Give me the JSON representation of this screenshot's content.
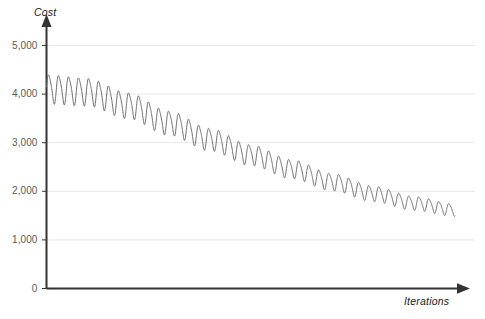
{
  "chart_data": {
    "type": "line",
    "title": "",
    "subtitle": "",
    "xlabel": "Iterations",
    "ylabel": "Cost",
    "grid": true,
    "legend": null,
    "legend_position": "none",
    "xlim": [
      0,
      1000
    ],
    "ylim": [
      0,
      5000
    ],
    "y_ticks": [
      0,
      1000,
      2000,
      3000,
      4000,
      5000
    ],
    "y_tick_labels": [
      "0",
      "1,000",
      "2,000",
      "3,000",
      "4,000",
      "5,000"
    ],
    "x_ticks": [],
    "x_tick_labels": [],
    "annotations": [],
    "series": [
      {
        "name": "Cost",
        "color": "#6e6e6e",
        "line_width": 1,
        "description": "High-frequency oscillating cost that decays from about 4,200 to about 1,550 over the run",
        "trend_points": [
          {
            "x": 0,
            "y": 4120
          },
          {
            "x": 100,
            "y": 4060
          },
          {
            "x": 200,
            "y": 3780
          },
          {
            "x": 300,
            "y": 3420
          },
          {
            "x": 400,
            "y": 3080
          },
          {
            "x": 500,
            "y": 2760
          },
          {
            "x": 600,
            "y": 2470
          },
          {
            "x": 700,
            "y": 2200
          },
          {
            "x": 800,
            "y": 1960
          },
          {
            "x": 900,
            "y": 1760
          },
          {
            "x": 1000,
            "y": 1620
          }
        ],
        "oscillation": {
          "period_x": 24.5,
          "amplitude_start": 290,
          "amplitude_end": 120,
          "waveform": "sine-with-sawtooth-bias"
        },
        "y_start": 4350,
        "y_end": 1550,
        "y_max": 4440,
        "y_min": 1440
      }
    ]
  },
  "axes": {
    "y_title": "Cost",
    "x_title": "Iterations",
    "y_tick_labels": [
      "5,000",
      "4,000",
      "3,000",
      "2,000",
      "1,000",
      "0"
    ],
    "axis_color": "#333333",
    "grid_color": "#e8e8e8",
    "tick_label_color": "#595959"
  },
  "colors": {
    "background": "#ffffff",
    "curve": "#6e6e6e",
    "grid": "#e8e8e8",
    "axis": "#333333"
  }
}
